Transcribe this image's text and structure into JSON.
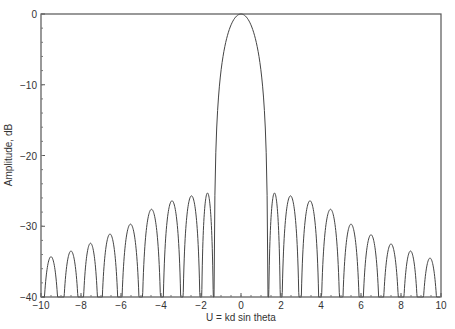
{
  "chart_data": {
    "type": "line",
    "title": "",
    "xlabel": "U = kd sin theta",
    "ylabel": "Amplitude, dB",
    "xlim": [
      -10,
      10
    ],
    "ylim": [
      -40,
      0
    ],
    "xticks": [
      -10,
      -8,
      -6,
      -4,
      -2,
      0,
      2,
      4,
      6,
      8,
      10
    ],
    "xtick_labels": [
      "−10",
      "−8",
      "−6",
      "−4",
      "−2",
      "0",
      "2",
      "4",
      "6",
      "8",
      "10"
    ],
    "yticks": [
      0,
      -10,
      -20,
      -30,
      -40
    ],
    "ytick_labels": [
      "0",
      "−10",
      "−20",
      "−30",
      "−40"
    ],
    "grid": false,
    "legend": null,
    "line_color": "#444444",
    "main_lobe": {
      "peak_u": 0,
      "peak_db": 0,
      "first_nulls": [
        -1.35,
        1.35
      ],
      "minus10db_width_u": [
        -0.95,
        0.95
      ]
    },
    "series": [
      {
        "name": "pattern",
        "sidelobe_peaks": [
          {
            "u": -9.5,
            "db": -34.3
          },
          {
            "u": -8.5,
            "db": -33.5
          },
          {
            "u": -7.5,
            "db": -32.4
          },
          {
            "u": -6.55,
            "db": -31.1
          },
          {
            "u": -5.55,
            "db": -29.7
          },
          {
            "u": -4.45,
            "db": -27.6
          },
          {
            "u": -3.45,
            "db": -26.4
          },
          {
            "u": -2.45,
            "db": -25.7
          },
          {
            "u": -1.65,
            "db": -25.3
          },
          {
            "u": 1.65,
            "db": -25.3
          },
          {
            "u": 2.5,
            "db": -25.7
          },
          {
            "u": 3.45,
            "db": -26.4
          },
          {
            "u": 4.45,
            "db": -27.6
          },
          {
            "u": 5.5,
            "db": -29.7
          },
          {
            "u": 6.5,
            "db": -31.2
          },
          {
            "u": 7.5,
            "db": -32.5
          },
          {
            "u": 8.45,
            "db": -33.5
          },
          {
            "u": 9.45,
            "db": -34.5
          }
        ],
        "nulls": [
          -10.0,
          -9.0,
          -8.0,
          -7.05,
          -6.05,
          -5.0,
          -3.95,
          -2.95,
          -2.0,
          -1.35,
          1.35,
          2.0,
          2.95,
          3.95,
          5.0,
          6.0,
          7.0,
          8.0,
          8.95,
          9.95
        ]
      }
    ]
  }
}
